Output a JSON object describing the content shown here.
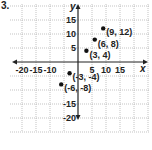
{
  "problem_number": "3.",
  "chart_data": {
    "type": "scatter",
    "title": "",
    "xlabel": "x",
    "ylabel": "y",
    "xlim": [
      -20,
      20
    ],
    "ylim": [
      -20,
      20
    ],
    "grid": true,
    "x_ticks": [
      -20,
      -15,
      -10,
      5,
      10,
      15
    ],
    "y_ticks": [
      15,
      10,
      5,
      -15,
      -20
    ],
    "x_tick_labels": [
      "-20",
      "-15",
      "-10",
      "5",
      "10",
      "15"
    ],
    "y_tick_labels": [
      "15",
      "10",
      "5",
      "-15",
      "-20"
    ],
    "points": [
      {
        "x": 9,
        "y": 12,
        "label": "(9, 12)"
      },
      {
        "x": 6,
        "y": 8,
        "label": "(6, 8)"
      },
      {
        "x": 3,
        "y": 4,
        "label": "(3, 4)"
      },
      {
        "x": -3,
        "y": -4,
        "label": "(-3, -4)"
      },
      {
        "x": -6,
        "y": -8,
        "label": "(-6, -8)"
      }
    ]
  },
  "colors": {
    "grid": "#9a9a9a",
    "axis": "#222222",
    "point": "#111111",
    "text": "#222222"
  }
}
